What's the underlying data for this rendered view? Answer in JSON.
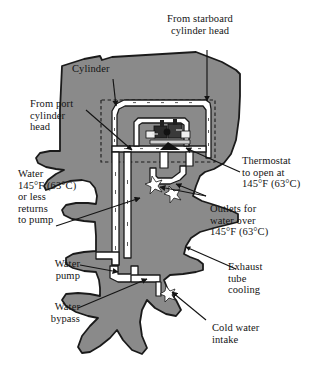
{
  "figure": {
    "type": "technical-cutaway-diagram",
    "colors": {
      "body_fill": "#8a8a8a",
      "outline": "#1a1a1a",
      "passage_fill": "#ffffff",
      "background": "#ffffff",
      "text": "#141414"
    }
  },
  "labels": {
    "from_starboard_cylinder_head": "From starboard\ncylinder head",
    "cylinder": "Cylinder",
    "from_port_cylinder_head": "From port\ncylinder\nhead",
    "thermostat": "Thermostat\nto open at\n145°F (63°C)",
    "water_returns_to_pump": "Water\n145°F (63°C)\nor less\nreturns\nto pump",
    "outlets_for_water_over": "Outlets for\nwater over\n145°F (63°C)",
    "water_pump": "Water\npump",
    "exhaust_tube_cooling": "Exhaust\ntube\ncooling",
    "water_bypass": "Water\nbypass",
    "cold_water_intake": "Cold water\nintake"
  },
  "callouts": [
    {
      "name": "from-starboard-cylinder-head",
      "text_key": "from_starboard_cylinder_head"
    },
    {
      "name": "cylinder",
      "text_key": "cylinder"
    },
    {
      "name": "from-port-cylinder-head",
      "text_key": "from_port_cylinder_head"
    },
    {
      "name": "thermostat",
      "text_key": "thermostat"
    },
    {
      "name": "water-returns-to-pump",
      "text_key": "water_returns_to_pump"
    },
    {
      "name": "outlets-for-water-over",
      "text_key": "outlets_for_water_over"
    },
    {
      "name": "water-pump",
      "text_key": "water_pump"
    },
    {
      "name": "exhaust-tube-cooling",
      "text_key": "exhaust_tube_cooling"
    },
    {
      "name": "water-bypass",
      "text_key": "water_bypass"
    },
    {
      "name": "cold-water-intake",
      "text_key": "cold_water_intake"
    }
  ],
  "temperatures": {
    "thermostat_open_f": 145,
    "thermostat_open_c": 63,
    "return_threshold_f": 145,
    "return_threshold_c": 63,
    "outlet_threshold_f": 145,
    "outlet_threshold_c": 63
  }
}
